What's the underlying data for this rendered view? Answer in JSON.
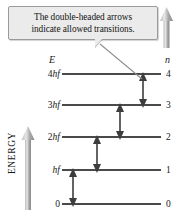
{
  "figure": {
    "type": "energy-level-diagram",
    "callout": {
      "line1": "The double-headed arrows",
      "line2": "indicate allowed transitions."
    },
    "axes": {
      "energy_axis_label": "ENERGY",
      "energy_column_header": "E",
      "quantum_number_column_header": "n"
    },
    "levels": [
      {
        "energy_label": "4hf",
        "energy_prefix": "4",
        "energy_italic": "hf",
        "n": "4"
      },
      {
        "energy_label": "3hf",
        "energy_prefix": "3",
        "energy_italic": "hf",
        "n": "3"
      },
      {
        "energy_label": "2hf",
        "energy_prefix": "2",
        "energy_italic": "hf",
        "n": "2"
      },
      {
        "energy_label": "hf",
        "energy_prefix": "",
        "energy_italic": "hf",
        "n": "1"
      },
      {
        "energy_label": "0",
        "energy_prefix": "0",
        "energy_italic": "",
        "n": "0"
      }
    ],
    "transitions": [
      {
        "from": "0",
        "to": "hf",
        "label": "0 to hf"
      },
      {
        "from": "hf",
        "to": "2hf",
        "label": "hf to 2hf"
      },
      {
        "from": "2hf",
        "to": "3hf",
        "label": "2hf to 3hf"
      },
      {
        "from": "3hf",
        "to": "4hf",
        "label": "3hf to 4hf"
      }
    ],
    "colors": {
      "level_line": "#4a4a4a",
      "arrow": "#3d3d3d",
      "callout_background": "#ebebeb",
      "callout_border": "#9a9a9a",
      "energy_arrow_light": "#d8d8d8",
      "energy_arrow_dark": "#8d8d8d",
      "text": "#181818"
    }
  }
}
